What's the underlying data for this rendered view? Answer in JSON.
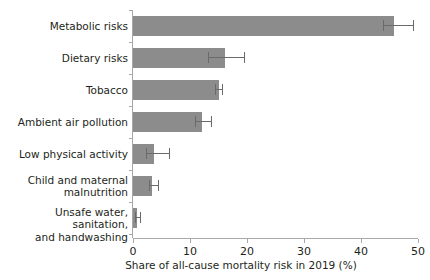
{
  "chart_data": {
    "type": "bar",
    "orientation": "horizontal",
    "title": "",
    "xlabel": "Share of all-cause mortality risk in 2019 (%)",
    "ylabel": "",
    "xlim": [
      0,
      50
    ],
    "xticks": [
      0,
      10,
      20,
      30,
      40,
      50
    ],
    "xticklabels": [
      "0",
      "10",
      "20",
      "30",
      "40",
      "50"
    ],
    "grid": false,
    "legend": null,
    "bar_color": "#8c8c8c",
    "errorbar_color": "#6a6a6a",
    "axis_color": "#a8a8a8",
    "text_color": "#231f20",
    "categories": [
      "Metabolic risks",
      "Dietary risks",
      "Tobacco",
      "Ambient air pollution",
      "Low physical activity",
      "Child and maternal malnutrition",
      "Unsafe water, sanitation, and handwashing"
    ],
    "category_lines": [
      [
        "Metabolic risks"
      ],
      [
        "Dietary risks"
      ],
      [
        "Tobacco"
      ],
      [
        "Ambient air pollution"
      ],
      [
        "Low physical activity"
      ],
      [
        "Child and maternal",
        "malnutrition"
      ],
      [
        "Unsafe water, sanitation,",
        "and handwashing"
      ]
    ],
    "values": [
      45.8,
      16.2,
      15.0,
      12.1,
      3.7,
      3.3,
      0.7
    ],
    "error_low": [
      43.8,
      13.2,
      14.3,
      10.9,
      2.3,
      2.8,
      0.4
    ],
    "error_high": [
      49.1,
      19.5,
      15.7,
      13.6,
      6.3,
      4.4,
      1.2
    ]
  }
}
